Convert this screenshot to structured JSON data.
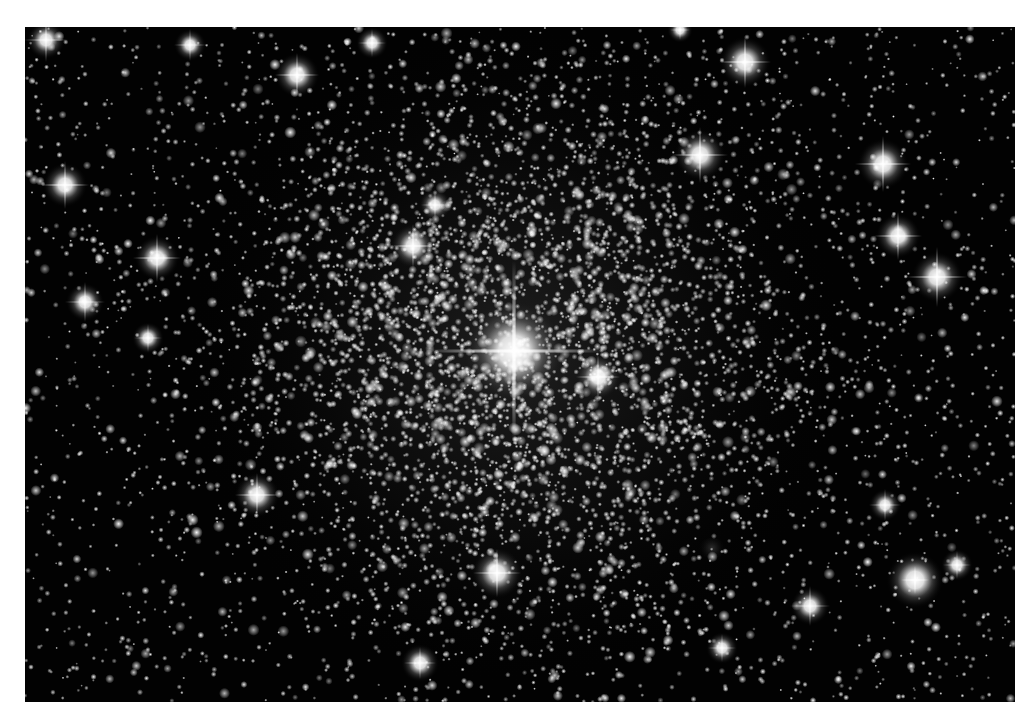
{
  "image": {
    "subject": "globular star cluster (astronomical photograph, black and white)",
    "frame": {
      "left": 25,
      "top": 27,
      "width": 990,
      "height": 675
    },
    "background_color": "#020202",
    "border_color": "#ffffff",
    "cluster_center": {
      "x": 515,
      "y": 355
    },
    "cluster_core_radius": 260,
    "seed": 1337,
    "field_star_count": 2600,
    "cluster_star_count": 4200,
    "bright_stars": [
      {
        "x": 514,
        "y": 351,
        "r": 16,
        "spike": 90
      },
      {
        "x": 46,
        "y": 40,
        "r": 6,
        "spike": 22
      },
      {
        "x": 190,
        "y": 45,
        "r": 5,
        "spike": 16
      },
      {
        "x": 297,
        "y": 75,
        "r": 7,
        "spike": 22
      },
      {
        "x": 372,
        "y": 43,
        "r": 5,
        "spike": 14
      },
      {
        "x": 745,
        "y": 62,
        "r": 8,
        "spike": 26
      },
      {
        "x": 700,
        "y": 155,
        "r": 8,
        "spike": 28
      },
      {
        "x": 883,
        "y": 164,
        "r": 8,
        "spike": 28
      },
      {
        "x": 898,
        "y": 236,
        "r": 7,
        "spike": 24
      },
      {
        "x": 937,
        "y": 277,
        "r": 8,
        "spike": 30
      },
      {
        "x": 65,
        "y": 185,
        "r": 7,
        "spike": 24
      },
      {
        "x": 157,
        "y": 258,
        "r": 7,
        "spike": 24
      },
      {
        "x": 85,
        "y": 302,
        "r": 6,
        "spike": 20
      },
      {
        "x": 413,
        "y": 246,
        "r": 7,
        "spike": 22
      },
      {
        "x": 435,
        "y": 205,
        "r": 5,
        "spike": 14
      },
      {
        "x": 598,
        "y": 377,
        "r": 7,
        "spike": 22
      },
      {
        "x": 257,
        "y": 495,
        "r": 7,
        "spike": 22
      },
      {
        "x": 497,
        "y": 573,
        "r": 8,
        "spike": 24
      },
      {
        "x": 810,
        "y": 606,
        "r": 6,
        "spike": 20
      },
      {
        "x": 915,
        "y": 580,
        "r": 9,
        "spike": 14
      },
      {
        "x": 957,
        "y": 565,
        "r": 5,
        "spike": 14
      },
      {
        "x": 885,
        "y": 505,
        "r": 5,
        "spike": 16
      },
      {
        "x": 148,
        "y": 338,
        "r": 5,
        "spike": 14
      },
      {
        "x": 680,
        "y": 30,
        "r": 4,
        "spike": 10
      },
      {
        "x": 420,
        "y": 663,
        "r": 6,
        "spike": 16
      },
      {
        "x": 722,
        "y": 648,
        "r": 5,
        "spike": 14
      }
    ],
    "galaxy_blobs": [
      {
        "x": 918,
        "y": 578,
        "rx": 22,
        "ry": 18,
        "opacity": 0.35
      },
      {
        "x": 712,
        "y": 548,
        "rx": 14,
        "ry": 10,
        "opacity": 0.2
      }
    ]
  }
}
